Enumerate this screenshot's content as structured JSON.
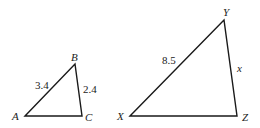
{
  "diagram": {
    "type": "similar-triangles",
    "colors": {
      "line": "#1a1a1a",
      "text": "#222222",
      "background": "#ffffff"
    },
    "triangles": [
      {
        "id": "ABC",
        "vertices": {
          "A": {
            "label": "A",
            "x": 25,
            "y": 116
          },
          "B": {
            "label": "B",
            "x": 75,
            "y": 64
          },
          "C": {
            "label": "C",
            "x": 82,
            "y": 116
          }
        },
        "sides": {
          "AB": {
            "label": "3.4"
          },
          "BC": {
            "label": "2.4"
          }
        }
      },
      {
        "id": "XYZ",
        "vertices": {
          "X": {
            "label": "X",
            "x": 130,
            "y": 116
          },
          "Y": {
            "label": "Y",
            "x": 224,
            "y": 20
          },
          "Z": {
            "label": "Z",
            "x": 237,
            "y": 116
          }
        },
        "sides": {
          "XY": {
            "label": "8.5"
          },
          "YZ": {
            "label": "x"
          }
        }
      }
    ]
  }
}
